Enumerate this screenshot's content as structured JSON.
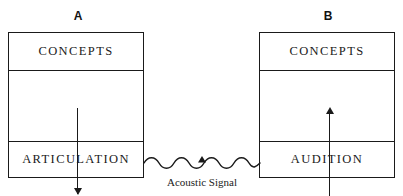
{
  "diagram": {
    "line_color": "#1a1a1a",
    "background": "#ffffff",
    "panels": [
      {
        "id": "A",
        "label": "A",
        "role": "speaker",
        "top_section": "CONCEPTS",
        "bottom_section": "ARTICULATION",
        "arrow_direction": "down",
        "arrow_meaning": "concepts-to-articulation"
      },
      {
        "id": "B",
        "label": "B",
        "role": "listener",
        "top_section": "CONCEPTS",
        "bottom_section": "AUDITION",
        "arrow_direction": "up",
        "arrow_meaning": "audition-to-concepts"
      }
    ],
    "channel": {
      "caption": "Acoustic Signal",
      "glyph": "wavy-arrow",
      "direction": "left-to-right",
      "from": "ARTICULATION",
      "to": "AUDITION"
    }
  }
}
